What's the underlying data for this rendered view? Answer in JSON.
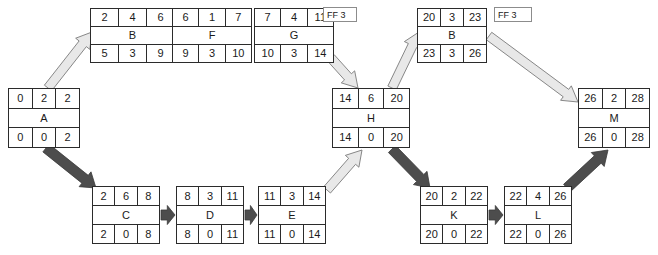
{
  "diagram": {
    "colors": {
      "node_border": "#2b2b2b",
      "node_fill": "#ffffff",
      "arrow_light_fill": "#e8e8e8",
      "arrow_light_stroke": "#7a7a7a",
      "arrow_dark_fill": "#4d4d4d",
      "arrow_dark_stroke": "#3a3a3a",
      "ff_border": "#8c8c8c",
      "text": "#1a1a1a"
    },
    "nodes": [
      {
        "id": "A",
        "name": "A",
        "es": "0",
        "dur": "2",
        "ef": "2",
        "ls": "0",
        "tf": "0",
        "lf": "2",
        "x": 8,
        "y": 88,
        "w": 72,
        "h": 60
      },
      {
        "id": "B1",
        "name": "B",
        "es": "2",
        "dur": "4",
        "ef": "6",
        "ls": "5",
        "tf": "3",
        "lf": "9",
        "x": 90,
        "y": 8,
        "w": 85,
        "h": 55
      },
      {
        "id": "F",
        "name": "F",
        "es": "6",
        "dur": "1",
        "ef": "7",
        "ls": "9",
        "tf": "3",
        "lf": "10",
        "x": 172,
        "y": 8,
        "w": 80,
        "h": 55
      },
      {
        "id": "G",
        "name": "G",
        "es": "7",
        "dur": "4",
        "ef": "11",
        "ls": "10",
        "tf": "3",
        "lf": "14",
        "x": 254,
        "y": 8,
        "w": 80,
        "h": 55
      },
      {
        "id": "H",
        "name": "H",
        "es": "14",
        "dur": "6",
        "ef": "20",
        "ls": "14",
        "tf": "0",
        "lf": "20",
        "x": 332,
        "y": 88,
        "w": 78,
        "h": 60
      },
      {
        "id": "B2",
        "name": "B",
        "es": "20",
        "dur": "3",
        "ef": "23",
        "ls": "23",
        "tf": "3",
        "lf": "26",
        "x": 417,
        "y": 8,
        "w": 70,
        "h": 55
      },
      {
        "id": "M",
        "name": "M",
        "es": "26",
        "dur": "2",
        "ef": "28",
        "ls": "26",
        "tf": "0",
        "lf": "28",
        "x": 578,
        "y": 88,
        "w": 72,
        "h": 60
      },
      {
        "id": "C",
        "name": "C",
        "es": "2",
        "dur": "6",
        "ef": "8",
        "ls": "2",
        "tf": "0",
        "lf": "8",
        "x": 92,
        "y": 186,
        "w": 68,
        "h": 58
      },
      {
        "id": "D",
        "name": "D",
        "es": "8",
        "dur": "3",
        "ef": "11",
        "ls": "8",
        "tf": "0",
        "lf": "11",
        "x": 176,
        "y": 186,
        "w": 68,
        "h": 58
      },
      {
        "id": "E",
        "name": "E",
        "es": "11",
        "dur": "3",
        "ef": "14",
        "ls": "11",
        "tf": "0",
        "lf": "14",
        "x": 258,
        "y": 186,
        "w": 68,
        "h": 58
      },
      {
        "id": "K",
        "name": "K",
        "es": "20",
        "dur": "2",
        "ef": "22",
        "ls": "20",
        "tf": "0",
        "lf": "22",
        "x": 420,
        "y": 186,
        "w": 68,
        "h": 58
      },
      {
        "id": "L",
        "name": "L",
        "es": "22",
        "dur": "4",
        "ef": "26",
        "ls": "22",
        "tf": "0",
        "lf": "26",
        "x": 504,
        "y": 186,
        "w": 68,
        "h": 58
      }
    ],
    "ff_labels": [
      {
        "id": "ff-1",
        "text": "FF 3",
        "x": 323,
        "y": 7,
        "w": 34,
        "h": 15
      },
      {
        "id": "ff-2",
        "text": "FF 3",
        "x": 494,
        "y": 7,
        "w": 38,
        "h": 15
      }
    ],
    "arrows": [
      {
        "id": "a-to-b1",
        "from": "A",
        "to": "B1",
        "style": "light",
        "x1": 48,
        "y1": 88,
        "x2": 92,
        "y2": 32
      },
      {
        "id": "b1-to-f",
        "from": "B1",
        "to": "F",
        "style": "light",
        "x1": 176,
        "y1": 36,
        "x2": 171,
        "y2": 36
      },
      {
        "id": "f-to-g",
        "from": "F",
        "to": "G",
        "style": "light",
        "x1": 253,
        "y1": 36,
        "x2": 253,
        "y2": 36
      },
      {
        "id": "g-to-h",
        "from": "G",
        "to": "H",
        "style": "light",
        "x1": 331,
        "y1": 58,
        "x2": 358,
        "y2": 88
      },
      {
        "id": "a-to-c",
        "from": "A",
        "to": "C",
        "style": "dark",
        "x1": 46,
        "y1": 148,
        "x2": 96,
        "y2": 188
      },
      {
        "id": "c-to-d",
        "from": "C",
        "to": "D",
        "style": "dark",
        "x1": 161,
        "y1": 215,
        "x2": 175,
        "y2": 215
      },
      {
        "id": "d-to-e",
        "from": "D",
        "to": "E",
        "style": "dark",
        "x1": 245,
        "y1": 215,
        "x2": 257,
        "y2": 215
      },
      {
        "id": "e-to-h",
        "from": "E",
        "to": "H",
        "style": "light",
        "x1": 327,
        "y1": 190,
        "x2": 362,
        "y2": 150
      },
      {
        "id": "h-to-b2",
        "from": "H",
        "to": "B2",
        "style": "light",
        "x1": 392,
        "y1": 88,
        "x2": 419,
        "y2": 32
      },
      {
        "id": "h-to-k",
        "from": "H",
        "to": "K",
        "style": "dark",
        "x1": 392,
        "y1": 149,
        "x2": 430,
        "y2": 188
      },
      {
        "id": "b2-to-m",
        "from": "B2",
        "to": "M",
        "style": "light",
        "x1": 489,
        "y1": 36,
        "x2": 578,
        "y2": 102
      },
      {
        "id": "k-to-l",
        "from": "K",
        "to": "L",
        "style": "dark",
        "x1": 489,
        "y1": 215,
        "x2": 503,
        "y2": 215
      },
      {
        "id": "l-to-m",
        "from": "L",
        "to": "M",
        "style": "dark",
        "x1": 567,
        "y1": 188,
        "x2": 608,
        "y2": 150
      }
    ]
  }
}
